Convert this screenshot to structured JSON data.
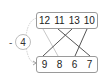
{
  "diagram": {
    "top_row": [
      "12",
      "11",
      "13",
      "10"
    ],
    "bottom_row": [
      "9",
      "8",
      "6",
      "7"
    ],
    "node": "4",
    "operator": "-",
    "connections": [
      {
        "from": "12",
        "to": "8",
        "style": "light"
      },
      {
        "from": "11",
        "to": "7",
        "style": "dark"
      },
      {
        "from": "13",
        "to": "9",
        "style": "dark"
      },
      {
        "from": "10",
        "to": "6",
        "style": "dark"
      }
    ],
    "colors": {
      "dark_line": "#555555",
      "light_line": "#c8c8c8",
      "box_border": "#9a9a9a"
    }
  }
}
